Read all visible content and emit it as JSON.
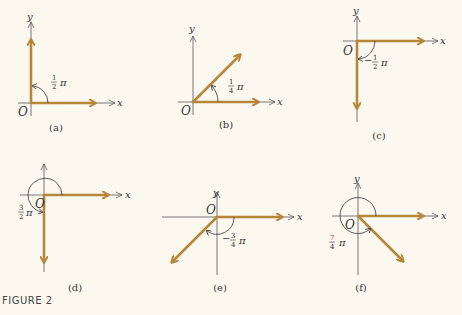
{
  "figure": {
    "caption": "FIGURE 2",
    "colors": {
      "vector": "#b8863a",
      "axis": "#555555",
      "background": "#fbf9ef",
      "label_red": "#b03030"
    },
    "panels": [
      {
        "id": "a",
        "label": "(a)",
        "angle_label": "1/2 π",
        "num": "1",
        "den": "2",
        "sign": "",
        "pi": "π",
        "origin": "O",
        "x": "x",
        "y": "y"
      },
      {
        "id": "b",
        "label": "(b)",
        "angle_label": "1/4 π",
        "num": "1",
        "den": "4",
        "sign": "",
        "pi": "π",
        "origin": "O",
        "x": "x",
        "y": "y"
      },
      {
        "id": "c",
        "label": "(c)",
        "angle_label": "−1/2 π",
        "num": "1",
        "den": "2",
        "sign": "−",
        "pi": "π",
        "origin": "O",
        "x": "x",
        "y": "y"
      },
      {
        "id": "d",
        "label": "(d)",
        "angle_label": "3/2 π",
        "num": "3",
        "den": "2",
        "sign": "",
        "pi": "π",
        "origin": "O",
        "x": "x",
        "y": "y"
      },
      {
        "id": "e",
        "label": "(e)",
        "angle_label": "−3/4 π",
        "num": "3",
        "den": "4",
        "sign": "−",
        "pi": "π",
        "origin": "O",
        "x": "x",
        "y": "y"
      },
      {
        "id": "f",
        "label": "(f)",
        "angle_label": "7/4 π",
        "num": "7",
        "den": "4",
        "sign": "",
        "pi": "π",
        "origin": "O",
        "x": "x",
        "y": "y"
      }
    ]
  }
}
